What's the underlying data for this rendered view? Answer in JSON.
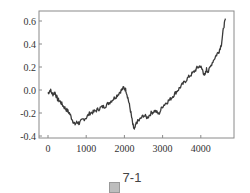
{
  "chart_data": {
    "type": "line",
    "title": "",
    "xlabel": "",
    "ylabel": "",
    "xlim": [
      -200,
      4850
    ],
    "ylim": [
      -0.4,
      0.68
    ],
    "grid": false,
    "legend": null,
    "xticks": [
      0,
      1000,
      2000,
      3000,
      4000
    ],
    "xtick_labels": [
      "0",
      "1000",
      "2000",
      "3000",
      "4000"
    ],
    "yticks": [
      -0.4,
      -0.2,
      0.0,
      0.2,
      0.4,
      0.6
    ],
    "ytick_labels": [
      "-0.4",
      "-0.2",
      "0.0",
      "0.2",
      "0.4",
      "0.6"
    ],
    "line_color": "#3a3a3a",
    "series": [
      {
        "name": "series",
        "x": [
          0,
          60,
          120,
          180,
          250,
          320,
          400,
          480,
          560,
          640,
          700,
          760,
          820,
          900,
          1000,
          1100,
          1200,
          1300,
          1400,
          1500,
          1600,
          1700,
          1800,
          1900,
          1980,
          2040,
          2100,
          2160,
          2220,
          2260,
          2320,
          2400,
          2500,
          2600,
          2700,
          2800,
          2900,
          3000,
          3100,
          3200,
          3300,
          3400,
          3500,
          3600,
          3700,
          3800,
          3900,
          3980,
          4050,
          4100,
          4150,
          4200,
          4300,
          4400,
          4480,
          4540,
          4600,
          4650
        ],
        "values": [
          -0.03,
          0.0,
          -0.04,
          -0.02,
          -0.08,
          -0.1,
          -0.14,
          -0.17,
          -0.2,
          -0.26,
          -0.3,
          -0.28,
          -0.29,
          -0.26,
          -0.24,
          -0.2,
          -0.19,
          -0.17,
          -0.15,
          -0.14,
          -0.11,
          -0.08,
          -0.05,
          -0.01,
          0.02,
          0.0,
          -0.08,
          -0.18,
          -0.3,
          -0.35,
          -0.28,
          -0.26,
          -0.22,
          -0.24,
          -0.2,
          -0.18,
          -0.21,
          -0.14,
          -0.11,
          -0.08,
          -0.04,
          0.0,
          0.04,
          0.08,
          0.12,
          0.15,
          0.19,
          0.21,
          0.17,
          0.12,
          0.18,
          0.16,
          0.24,
          0.3,
          0.34,
          0.4,
          0.55,
          0.62
        ]
      }
    ]
  },
  "caption": {
    "glyph": "图",
    "text": "7-1"
  }
}
